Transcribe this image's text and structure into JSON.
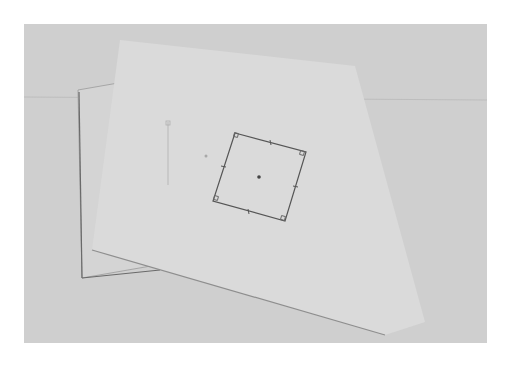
{
  "photo": {
    "description": "Photograph of two overlapping sheets of paper on a grey surface; a rotated square with corner and midpoint markers and a center dot is drawn on the front sheet, with a faint partial square on the back sheet.",
    "colors": {
      "background": "#cfcfcf",
      "back_sheet": "#d6d6d6",
      "front_sheet": "#dcdcdc",
      "ink": "#555555",
      "faint_ink": "#b0b0b0"
    }
  }
}
